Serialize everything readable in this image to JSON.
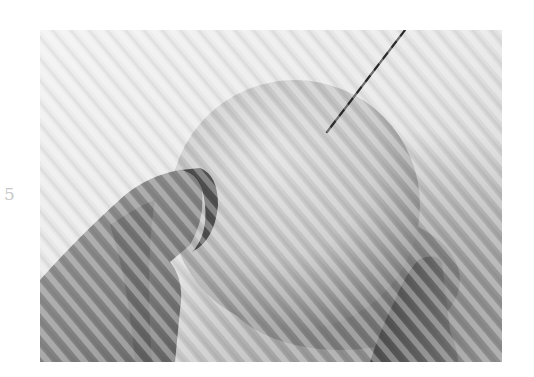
{
  "page": {
    "page_number": "5"
  },
  "photo": {
    "subject": "hand holding a ball pierced by a needle",
    "style": "grayscale",
    "colors": {
      "background_light": "#eeeeee",
      "background_mid": "#cfcfcf",
      "ball_light": "#d8d8d8",
      "ball_shadow": "#8a8a8a",
      "hand": "#8e8e8e",
      "hand_shadow": "#3a3a3a",
      "needle": "#2a2a2a"
    }
  }
}
